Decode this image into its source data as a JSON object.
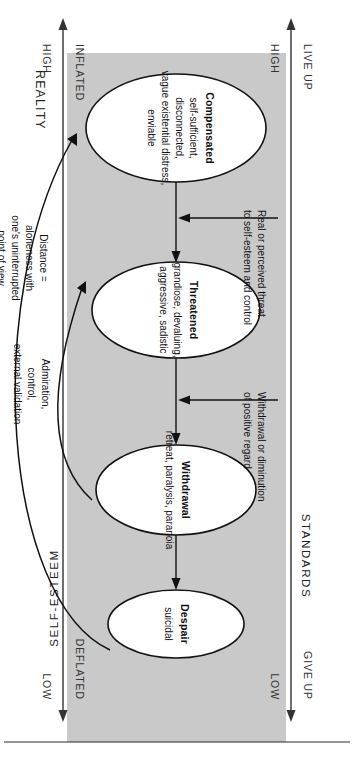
{
  "diagram": {
    "band_label": "REALITY",
    "axes": {
      "top": {
        "name": "STANDARDS",
        "left_primary": "HIGH",
        "left_secondary": "LIVE UP",
        "right_primary": "LOW",
        "right_secondary": "GIVE UP"
      },
      "bottom": {
        "name": "SELF-ESTEEM",
        "left_primary": "HIGH",
        "left_secondary": "INFLATED",
        "right_primary": "LOW",
        "right_secondary": "DEFLATED"
      }
    },
    "states": [
      {
        "id": "compensated",
        "title": "Compensated",
        "lines": [
          "self-sufficient,",
          "disconnected,",
          "vague existential distress,",
          "enviable"
        ]
      },
      {
        "id": "threatened",
        "title": "Threatened",
        "lines": [
          "grandiose, devaluing,",
          "aggressive, sadistic"
        ]
      },
      {
        "id": "withdrawal",
        "title": "Withdrawal",
        "lines": [
          "retreat, paralysis, paranoia"
        ]
      },
      {
        "id": "despair",
        "title": "Despair",
        "lines": [
          "suicidal"
        ]
      }
    ],
    "trigger_arrows": [
      {
        "id": "threat",
        "lines": [
          "Real or perceived threat",
          "to self-esteem and control"
        ]
      },
      {
        "id": "withdrawal-regard",
        "lines": [
          "Withdrawal or diminution",
          "of positive regard"
        ]
      }
    ],
    "feedback_arrows": [
      {
        "id": "admiration",
        "lines": [
          "Admiration,",
          "control,",
          "external validation"
        ]
      },
      {
        "id": "distance",
        "lines": [
          "Distance =",
          "aloneness with",
          "one's uninterrupted",
          "point of view"
        ]
      }
    ],
    "colors": {
      "band": "#c9c9c9",
      "stroke": "#111111",
      "axis": "#333333",
      "background": "#ffffff"
    }
  }
}
